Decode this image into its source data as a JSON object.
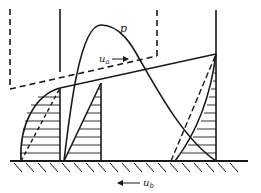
{
  "diagram": {
    "labels": {
      "pressure": "p",
      "upper_velocity": "u",
      "upper_velocity_sub": "a",
      "lower_velocity": "u",
      "lower_velocity_sub": "b"
    },
    "colors": {
      "ink": "#1a1a1a",
      "background": "#ffffff"
    }
  }
}
